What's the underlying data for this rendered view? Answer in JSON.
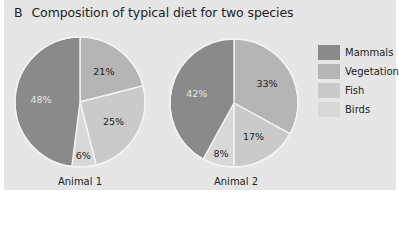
{
  "header": {
    "panel_letter": "B",
    "title": "Composition of typical diet for two species"
  },
  "colors": {
    "Mammals": "#8a8a8a",
    "Vegetation": "#b5b5b5",
    "Fish": "#cacaca",
    "Birds": "#d8d8d8",
    "background": "#e6e6e6"
  },
  "legend": [
    {
      "label": "Mammals",
      "color": "#8a8a8a"
    },
    {
      "label": "Vegetation",
      "color": "#b5b5b5"
    },
    {
      "label": "Fish",
      "color": "#cacaca"
    },
    {
      "label": "Birds",
      "color": "#d8d8d8"
    }
  ],
  "chart_data": [
    {
      "type": "pie",
      "title": "Composition of typical diet for two species",
      "label": "Animal 1",
      "categories": [
        "Vegetation",
        "Fish",
        "Birds",
        "Mammals"
      ],
      "values": [
        21,
        25,
        6,
        48
      ],
      "value_labels": [
        "21%",
        "25%",
        "6%",
        "48%"
      ],
      "start_angle_deg": 0,
      "direction": "clockwise",
      "legend_position": "right"
    },
    {
      "type": "pie",
      "title": "Composition of typical diet for two species",
      "label": "Animal 2",
      "categories": [
        "Vegetation",
        "Fish",
        "Birds",
        "Mammals"
      ],
      "values": [
        33,
        17,
        8,
        42
      ],
      "value_labels": [
        "33%",
        "17%",
        "8%",
        "42%"
      ],
      "start_angle_deg": 0,
      "direction": "clockwise",
      "legend_position": "right"
    }
  ]
}
